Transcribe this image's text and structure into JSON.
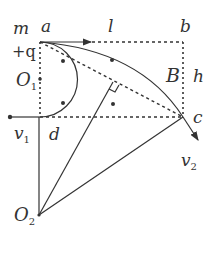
{
  "figure": {
    "labels": {
      "m": "m",
      "charge": "+q",
      "a": "a",
      "b": "b",
      "c": "c",
      "d": "d",
      "l": "l",
      "h": "h",
      "B": "B",
      "O1": "O",
      "O1_sub": "1",
      "O2": "O",
      "O2_sub": "2",
      "v1": "v",
      "v1_sub": "1",
      "v2": "v",
      "v2_sub": "2"
    },
    "points": {
      "a": [
        40,
        42
      ],
      "b": [
        183,
        42
      ],
      "c": [
        183,
        117
      ],
      "d": [
        40,
        117
      ],
      "O1": [
        40,
        79
      ],
      "O2": [
        39,
        215
      ]
    },
    "field_dots": [
      [
        63,
        61
      ],
      [
        63,
        103
      ],
      [
        112,
        60
      ],
      [
        113,
        104
      ]
    ],
    "colors": {
      "ink": "#333333",
      "background": "#ffffff"
    }
  }
}
